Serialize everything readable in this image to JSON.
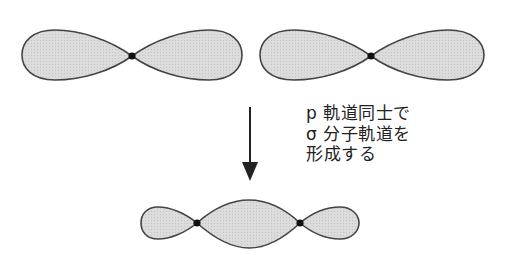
{
  "diagram": {
    "colors": {
      "lobe_fill": "#d9d9d9",
      "lobe_stroke": "#444444",
      "node": "#111111",
      "arrow": "#222222"
    },
    "top_left_orbital": {
      "label": "p-orbital-left"
    },
    "top_right_orbital": {
      "label": "p-orbital-right"
    },
    "result_orbital": {
      "label": "sigma-molecular-orbital"
    },
    "caption": {
      "lines": [
        "p 軌道同士で",
        "σ 分子軌道を",
        "形成する"
      ]
    }
  }
}
